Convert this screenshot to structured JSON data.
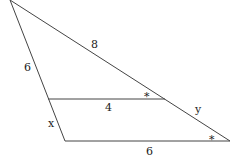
{
  "diagram": {
    "labels": {
      "top_left_side": "6",
      "top_right_side": "8",
      "mid_segment": "4",
      "lower_left_side": "x",
      "lower_right_side": "y",
      "base": "6",
      "angle_mark_top": "*",
      "angle_mark_bottom": "*"
    },
    "colors": {
      "line": "#444444",
      "text": "#222222"
    }
  }
}
